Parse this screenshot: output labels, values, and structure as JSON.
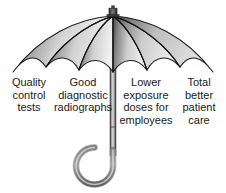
{
  "figure": {
    "background_color": "#ffffff",
    "text_color": "#1a1a1a"
  },
  "umbrella": {
    "canopy": {
      "panel_count": 6,
      "outline_color": "#1c1c1c",
      "shade_dark": "#4a4a4a",
      "shade_mid": "#9a9a9a",
      "shade_light": "#eeeeee",
      "rib_color": "#111111"
    },
    "finial": {
      "name": "finial",
      "color": "#3a3a3a"
    },
    "shaft": {
      "name": "shaft",
      "color": "#8d8d8d",
      "highlight_color": "#d8d8d8",
      "edge_color": "#3f3f3f"
    },
    "handle": {
      "name": "j-hook-handle",
      "color": "#7e7e7e",
      "edge_color": "#3a3a3a"
    }
  },
  "labels": [
    {
      "id": "quality-control-tests",
      "lines": [
        "Quality",
        "control",
        "tests"
      ]
    },
    {
      "id": "good-diagnostic-radiographs",
      "lines": [
        "Good",
        "diagnostic",
        "radiographs"
      ]
    },
    {
      "id": "lower-exposure-doses-for-employees",
      "lines": [
        "Lower",
        "exposure",
        "doses for",
        "employees"
      ]
    },
    {
      "id": "total-better-patient-care",
      "lines": [
        "Total",
        "better",
        "patient",
        "care"
      ]
    }
  ]
}
